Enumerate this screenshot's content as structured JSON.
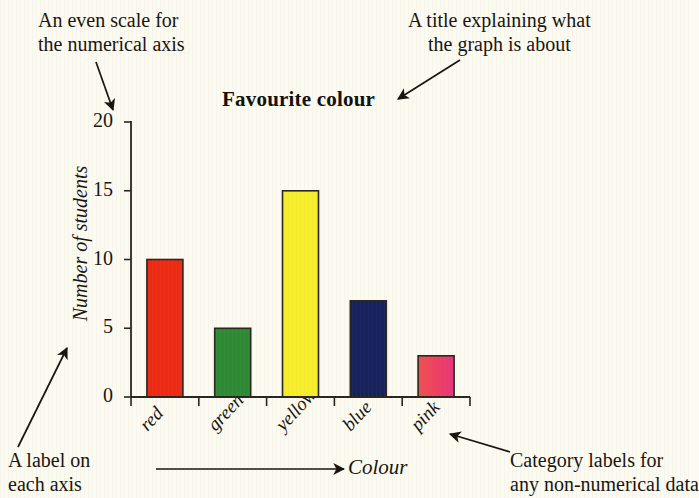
{
  "annotations": {
    "scale_note": "An even scale for\nthe numerical axis",
    "title_note": "A title explaining what\nthe graph is about",
    "axis_note": "A label on\neach axis",
    "category_note": "Category labels for\nany non-numerical data"
  },
  "chart_data": {
    "type": "bar",
    "title": "Favourite colour",
    "xlabel": "Colour",
    "ylabel": "Number of students",
    "categories": [
      "red",
      "green",
      "yellow",
      "blue",
      "pink"
    ],
    "values": [
      10,
      5,
      15,
      7,
      3
    ],
    "bar_colors": [
      "#ee2a14",
      "#2e8b35",
      "#f7ee2a",
      "#16225e",
      "#ef3f63"
    ],
    "ylim": [
      0,
      20
    ],
    "yticks": [
      0,
      5,
      10,
      15,
      20
    ],
    "ytick_labels": [
      "0",
      "5",
      "10",
      "15",
      "20"
    ],
    "grid": false,
    "legend": "none"
  },
  "colors": {
    "background": "#fcfbf2",
    "ink": "#17130f",
    "axis": "#2a2520"
  }
}
